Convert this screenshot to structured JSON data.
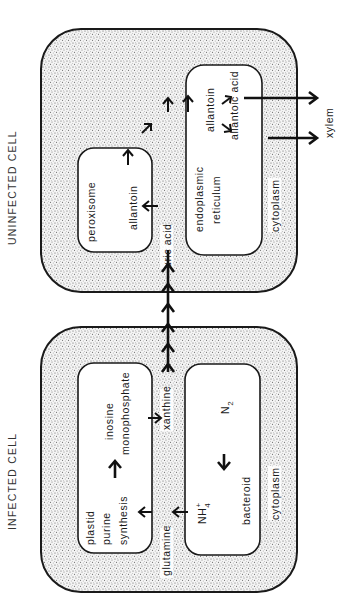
{
  "titles": {
    "uninfected": "UNINFECTED CELL",
    "infected": "INFECTED CELL"
  },
  "uninfected_cell": {
    "organelles": {
      "peroxisome": "peroxisome",
      "er_line1": "endoplasmic",
      "er_line2": "reticulum"
    },
    "metabolites": {
      "uric_acid": "uric acid",
      "allantoin_peroxisome": "allantoin",
      "allantoin_er": "allantoin",
      "allantoic_acid": "allantoic acid"
    },
    "compartment": "cytoplasm"
  },
  "infected_cell": {
    "organelles": {
      "plastid": "plastid",
      "bacteroid": "bacteroid"
    },
    "metabolites": {
      "purine": "purine",
      "synthesis": "synthesis",
      "inosine": "inosine",
      "monophosphate": "monophosphate",
      "glutamine": "glutamine",
      "xanthine": "xanthine",
      "nh4": "NH",
      "nh4_sub": "4",
      "nh4_sup": "+",
      "n2": "N",
      "n2_sub": "2"
    },
    "compartment": "cytoplasm"
  },
  "external": {
    "xylem": "xylem"
  },
  "colors": {
    "line": "#1a1a1a",
    "stipple": "#8a8a8a",
    "background": "#ffffff"
  }
}
